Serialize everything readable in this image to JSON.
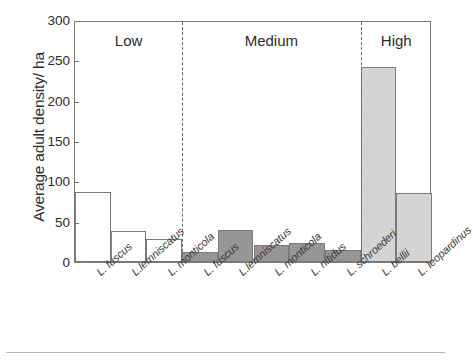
{
  "figure": {
    "background_color": "#ffffff",
    "frame_color": "#7a7a7a"
  },
  "axes": {
    "y_title": "Average adult density/ ha",
    "y_ticks": [
      "0",
      "50",
      "100",
      "150",
      "200",
      "250",
      "300"
    ],
    "y_min": 0,
    "y_max": 300
  },
  "groups": [
    {
      "label": "Low",
      "color": "#ffffff"
    },
    {
      "label": "Medium",
      "color": "#969696"
    },
    {
      "label": "High",
      "color": "#d4d4d4"
    }
  ],
  "chart_data": {
    "type": "bar",
    "title": "",
    "xlabel": "",
    "ylabel": "Average adult density/ ha",
    "ylim": [
      0,
      300
    ],
    "yticks": [
      0,
      50,
      100,
      150,
      200,
      250,
      300
    ],
    "grid": false,
    "legend": "none",
    "group_labels": [
      "Low",
      "Medium",
      "High"
    ],
    "group_counts": [
      3,
      5,
      2
    ],
    "categories": [
      "L. fuscus",
      "L.lemniscatus",
      "L. monticola",
      "L. fuscus",
      "L.lemniscatus",
      "L. monticola",
      "L. nitidus",
      "L. schroederi",
      "L. bellii",
      "L. leopardinus"
    ],
    "values": [
      87,
      38,
      28,
      13,
      40,
      21,
      23,
      15,
      242,
      85
    ],
    "bar_groups": [
      "Low",
      "Low",
      "Low",
      "Medium",
      "Medium",
      "Medium",
      "Medium",
      "Medium",
      "High",
      "High"
    ],
    "bar_colors": [
      "#ffffff",
      "#ffffff",
      "#ffffff",
      "#969696",
      "#969696",
      "#969696",
      "#969696",
      "#969696",
      "#d4d4d4",
      "#d4d4d4"
    ]
  }
}
